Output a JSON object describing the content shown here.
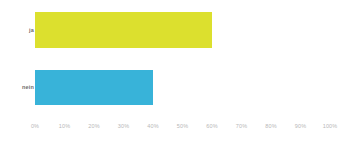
{
  "chart_data": {
    "type": "bar",
    "orientation": "horizontal",
    "title": "",
    "subtitle": "",
    "xlabel": "",
    "ylabel": "",
    "categories": [
      "ja",
      "nein"
    ],
    "values": [
      60,
      40
    ],
    "value_unit": "%",
    "xlim": [
      0,
      100
    ],
    "xticks": [
      0,
      10,
      20,
      30,
      40,
      50,
      60,
      70,
      80,
      90,
      100
    ],
    "xticklabels": [
      "0%",
      "10%",
      "20%",
      "30%",
      "40%",
      "50%",
      "60%",
      "70%",
      "80%",
      "90%",
      "100%"
    ],
    "grid": false,
    "legend": null,
    "legend_position": "none",
    "bar_colors": [
      "#dce02e",
      "#38b3d9"
    ],
    "background_color": "#ffffff",
    "tick_label_color": "#b8b8b8",
    "category_label_color": "#6d6d6d",
    "series": [
      {
        "name": "Anteil",
        "points": [
          {
            "category": "ja",
            "value": 60,
            "color": "#dce02e"
          },
          {
            "category": "nein",
            "value": 40,
            "color": "#38b3d9"
          }
        ]
      }
    ]
  }
}
